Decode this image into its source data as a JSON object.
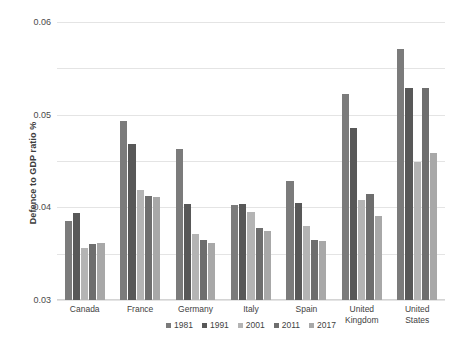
{
  "chart_data": {
    "type": "bar",
    "title": "",
    "xlabel": "",
    "ylabel": "Defence to GDP ratio %",
    "ylim": [
      0,
      0.06
    ],
    "ytick_labels": [
      "0.06",
      "0.05",
      "0.04",
      "0.03",
      "0.02",
      "0.01",
      "0"
    ],
    "ytick_values": [
      0.06,
      0.05,
      0.04,
      0.03,
      0.02,
      0.01,
      0
    ],
    "grid": true,
    "legend_position": "bottom",
    "categories": [
      "Canada",
      "France",
      "Germany",
      "Italy",
      "Spain",
      "United Kingdom",
      "United States"
    ],
    "category_lines": [
      [
        "Canada"
      ],
      [
        "France"
      ],
      [
        "Germany"
      ],
      [
        "Italy"
      ],
      [
        "Spain"
      ],
      [
        "United",
        "Kingdom"
      ],
      [
        "United",
        "States"
      ]
    ],
    "series": [
      {
        "name": "1981",
        "color": "#7b7b7b",
        "values": [
          0.017,
          0.0387,
          0.0325,
          0.0205,
          0.0257,
          0.0445,
          0.0542
        ]
      },
      {
        "name": "1991",
        "color": "#585858",
        "values": [
          0.0188,
          0.0337,
          0.0208,
          0.0207,
          0.021,
          0.0372,
          0.0457
        ]
      },
      {
        "name": "2001",
        "color": "#b4b4b4",
        "values": [
          0.0112,
          0.0237,
          0.0142,
          0.019,
          0.016,
          0.0215,
          0.0298
        ]
      },
      {
        "name": "2011",
        "color": "#6e6e6e",
        "values": [
          0.012,
          0.0225,
          0.013,
          0.0155,
          0.013,
          0.0228,
          0.0457
        ]
      },
      {
        "name": "2017",
        "color": "#a8a8a8",
        "values": [
          0.0124,
          0.0223,
          0.0123,
          0.015,
          0.0128,
          0.0182,
          0.0318
        ]
      }
    ]
  },
  "colors": {
    "gridline": "#e4e4e4",
    "axis": "#d4d4d4",
    "text": "#3f3f3f",
    "background": "#ffffff"
  }
}
